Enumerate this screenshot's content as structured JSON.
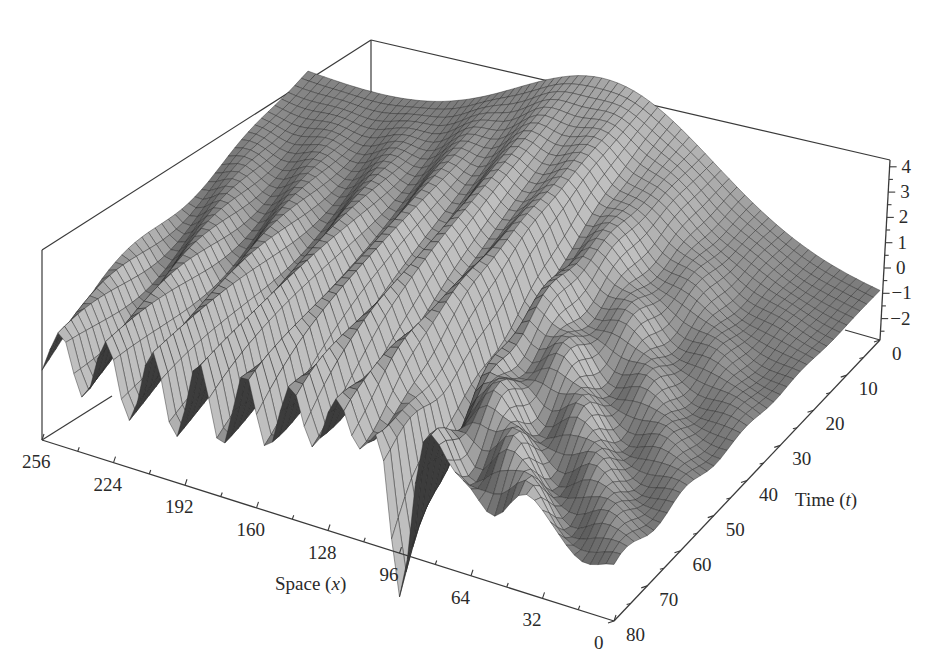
{
  "chart_data": {
    "type": "surface",
    "title": "",
    "xlabel": "Space",
    "xlabel_var": "x",
    "ylabel": "Time",
    "ylabel_var": "t",
    "zlabel": "",
    "x_ticks": [
      256,
      224,
      192,
      160,
      128,
      96,
      64,
      32,
      0
    ],
    "y_ticks": [
      0,
      10,
      20,
      30,
      40,
      50,
      60,
      70,
      80
    ],
    "z_ticks": [
      4,
      3,
      2,
      1,
      0,
      -1,
      -2
    ],
    "x_range": [
      0,
      256
    ],
    "y_range": [
      0,
      80
    ],
    "z_range": [
      -2.8,
      4.2
    ],
    "grid": false,
    "legend": null,
    "surface_features": {
      "initial_profile_peak": {
        "x": 96,
        "t": 0,
        "z": 4.0
      },
      "deep_trough": {
        "x": 96,
        "t": 80,
        "z": -2.8
      },
      "edge_value_x0": -1.0,
      "edge_value_x256": 0.5
    }
  },
  "axes": {
    "space": {
      "title": "Space (",
      "var": "x",
      "close": ")",
      "tick_labels": [
        "256",
        "224",
        "192",
        "160",
        "128",
        "96",
        "64",
        "32",
        "0"
      ]
    },
    "time": {
      "title": "Time (",
      "var": "t",
      "close": ")",
      "tick_labels": [
        "0",
        "10",
        "20",
        "30",
        "40",
        "50",
        "60",
        "70",
        "80"
      ]
    },
    "z": {
      "tick_labels": [
        "4",
        "3",
        "2",
        "1",
        "0",
        "−1",
        "−2"
      ]
    }
  },
  "colors": {
    "axis": "#3a3a3a",
    "mesh_light": "#b8b8b8",
    "mesh_dark": "#1e1e1e",
    "background": "#ffffff"
  }
}
